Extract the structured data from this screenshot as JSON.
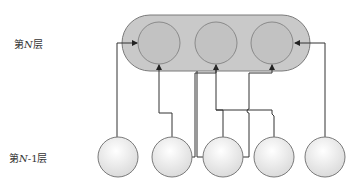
{
  "labels": {
    "layer_n": "第N层",
    "layer_n_prefix": "第",
    "layer_n_var": "N",
    "layer_n_suffix": "层",
    "layer_n_minus_1": "第N-1层",
    "layer_n_minus_1_prefix": "第",
    "layer_n_minus_1_var": "N",
    "layer_n_minus_1_suffix": "-1层"
  },
  "layers": {
    "top": {
      "name": "layer N",
      "node_count": 3
    },
    "bottom": {
      "name": "layer N-1",
      "node_count": 5
    }
  },
  "colors": {
    "pill_fill": "#c9c9c9",
    "pill_stroke": "#7a7a7a",
    "top_node_fill": "#c2c2c2",
    "top_node_stroke": "#8a8a8a",
    "bottom_node_fill_light": "#ffffff",
    "bottom_node_fill_dark": "#dcdcdc",
    "bottom_node_stroke": "#7a7a7a",
    "line": "#333333"
  }
}
